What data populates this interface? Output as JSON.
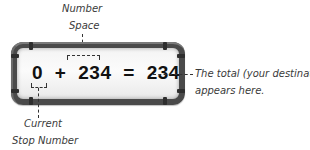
{
  "diagram": {
    "equation": {
      "current_stop": "0",
      "plus": "+",
      "number_space": "234",
      "equals": "=",
      "total": "234"
    },
    "callouts": {
      "number_space": {
        "line1": "Number",
        "line2": "Space"
      },
      "current_stop": {
        "line1": "Current",
        "line2": "Stop Number"
      },
      "total": {
        "line1": "The total (your destination)",
        "line2": "appears here."
      }
    },
    "colors": {
      "frame": "#4a4a4a",
      "panel": "#f4f4f4",
      "text": "#111111",
      "label": "#3a3a3a"
    }
  }
}
